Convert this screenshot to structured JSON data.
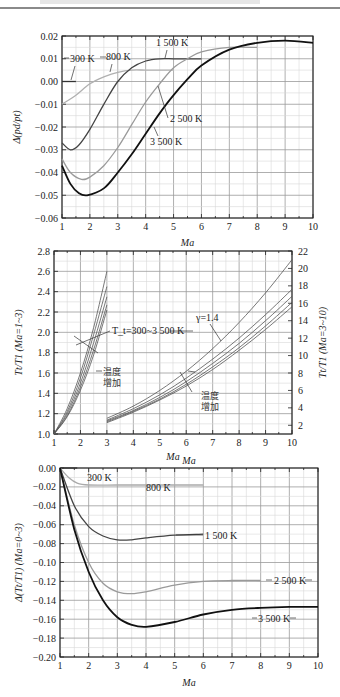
{
  "page": {
    "header_rule": true
  },
  "chart_data": [
    {
      "type": "line",
      "title": "",
      "xlabel": "Ma",
      "ylabel": "Δ(p_d/p_t)",
      "xlim": [
        1,
        10
      ],
      "ylim": [
        -0.06,
        0.02
      ],
      "xticks": [
        "1",
        "2",
        "3",
        "4",
        "5",
        "6",
        "7",
        "8",
        "9",
        "10"
      ],
      "yticks": [
        "0.02",
        "0.01",
        "0.00",
        "-0.01",
        "-0.02",
        "-0.03",
        "-0.04",
        "-0.05",
        "-0.06"
      ],
      "grid": true,
      "series": [
        {
          "name": "300 K",
          "color": "#333333",
          "x": [
            1.0,
            1.5
          ],
          "y": [
            0.0,
            0.0
          ]
        },
        {
          "name": "800 K",
          "color": "#b0b0b0",
          "x": [
            1.0,
            1.5,
            2.0,
            2.5,
            3.0,
            3.5,
            4.0,
            4.5,
            5.0
          ],
          "y": [
            -0.01,
            -0.006,
            -0.001,
            0.002,
            0.004,
            0.005,
            0.005,
            0.005,
            0.005
          ]
        },
        {
          "name": "1 500 K",
          "color": "#444444",
          "x": [
            1.0,
            1.3,
            1.6,
            2.0,
            2.5,
            3.0,
            3.5,
            4.0,
            4.5,
            5.0,
            5.5,
            6.0
          ],
          "y": [
            -0.027,
            -0.03,
            -0.028,
            -0.021,
            -0.01,
            0.0,
            0.006,
            0.009,
            0.01,
            0.01,
            0.01,
            0.01
          ]
        },
        {
          "name": "2 500 K",
          "color": "#9a9a9a",
          "x": [
            1.0,
            1.3,
            1.7,
            2.0,
            2.5,
            3.0,
            3.5,
            4.0,
            4.5,
            5.0,
            5.5,
            6.0,
            7.0,
            8.0
          ],
          "y": [
            -0.034,
            -0.04,
            -0.043,
            -0.042,
            -0.037,
            -0.029,
            -0.019,
            -0.009,
            -0.001,
            0.006,
            0.01,
            0.013,
            0.015,
            0.015
          ]
        },
        {
          "name": "3 500 K",
          "color": "#111111",
          "x": [
            1.0,
            1.3,
            1.6,
            1.9,
            2.5,
            3.0,
            3.5,
            4.0,
            4.5,
            5.0,
            5.5,
            6.0,
            7.0,
            8.0,
            9.0,
            10.0
          ],
          "y": [
            -0.037,
            -0.045,
            -0.049,
            -0.05,
            -0.047,
            -0.04,
            -0.032,
            -0.023,
            -0.014,
            -0.006,
            0.001,
            0.007,
            0.014,
            0.017,
            0.018,
            0.017
          ]
        }
      ],
      "annotations": [
        "300 K",
        "800 K",
        "1 500 K",
        "2 500 K",
        "3 500 K"
      ]
    },
    {
      "type": "line",
      "title": "",
      "xlabel": "Ma",
      "ylabel": "T_t/T_1 (Ma=1~3)",
      "ylabel_right": "T_t/T_1 (Ma=3~10)",
      "xlim": [
        1,
        10
      ],
      "ylim": [
        1.0,
        2.8
      ],
      "ylim_right": [
        1,
        22
      ],
      "xticks": [
        "1",
        "2",
        "3",
        "4",
        "5",
        "6",
        "7",
        "8",
        "9",
        "10"
      ],
      "yticks": [
        "2.8",
        "2.6",
        "2.4",
        "2.2",
        "2.0",
        "1.8",
        "1.6",
        "1.4",
        "1.2",
        "1.0"
      ],
      "yticks_right": [
        "22",
        "20",
        "18",
        "16",
        "14",
        "12",
        "10",
        "8",
        "6",
        "4",
        "2"
      ],
      "grid": true,
      "series": [
        {
          "name": "γ=1.4 (Ma 1-3)",
          "axis": "left",
          "x": [
            1.0,
            1.5,
            2.0,
            2.5,
            3.0
          ],
          "y": [
            1.0,
            1.25,
            1.6,
            2.05,
            2.6
          ]
        },
        {
          "name": "T 800 K (Ma 1-3)",
          "axis": "left",
          "x": [
            1.0,
            1.5,
            2.0,
            2.5,
            3.0
          ],
          "y": [
            1.0,
            1.22,
            1.55,
            1.98,
            2.45
          ]
        },
        {
          "name": "T 1 500 K (Ma 1-3)",
          "axis": "left",
          "x": [
            1.0,
            1.5,
            2.0,
            2.5,
            3.0
          ],
          "y": [
            1.0,
            1.2,
            1.5,
            1.9,
            2.35
          ]
        },
        {
          "name": "T 2 500 K (Ma 1-3)",
          "axis": "left",
          "x": [
            1.0,
            1.5,
            2.0,
            2.5,
            3.0
          ],
          "y": [
            1.0,
            1.18,
            1.46,
            1.83,
            2.27
          ]
        },
        {
          "name": "T 3 500 K (Ma 1-3)",
          "axis": "left",
          "x": [
            1.0,
            1.5,
            2.0,
            2.5,
            3.0
          ],
          "y": [
            1.0,
            1.17,
            1.43,
            1.78,
            2.22
          ]
        },
        {
          "name": "γ=1.4 (Ma 3-10)",
          "axis": "right",
          "x": [
            3,
            4,
            5,
            6,
            7,
            8,
            9,
            10
          ],
          "y": [
            2.8,
            4.2,
            6.0,
            8.2,
            10.8,
            13.8,
            17.2,
            21.0
          ]
        },
        {
          "name": "T 800 K (Ma 3-10)",
          "axis": "right",
          "x": [
            3,
            4,
            5,
            6,
            7,
            8,
            9,
            10
          ],
          "y": [
            2.6,
            3.9,
            5.5,
            7.4,
            9.6,
            12.0,
            14.7,
            17.6
          ]
        },
        {
          "name": "T 1 500 K (Ma 3-10)",
          "axis": "right",
          "x": [
            3,
            4,
            5,
            6,
            7,
            8,
            9,
            10
          ],
          "y": [
            2.5,
            3.7,
            5.2,
            7.0,
            9.1,
            11.4,
            14.0,
            16.8
          ]
        },
        {
          "name": "T 2 500 K (Ma 3-10)",
          "axis": "right",
          "x": [
            3,
            4,
            5,
            6,
            7,
            8,
            9,
            10
          ],
          "y": [
            2.4,
            3.6,
            5.0,
            6.7,
            8.7,
            10.9,
            13.4,
            16.1
          ]
        },
        {
          "name": "T 3 500 K (Ma 3-10)",
          "axis": "right",
          "x": [
            3,
            4,
            5,
            6,
            7,
            8,
            9,
            10
          ],
          "y": [
            2.3,
            3.5,
            4.9,
            6.5,
            8.4,
            10.6,
            13.0,
            15.6
          ]
        }
      ],
      "annotations": [
        "T_t=300~3 500 K",
        "γ=1.4",
        "温度增加",
        "温度增加"
      ]
    },
    {
      "type": "line",
      "title": "",
      "xlabel": "Ma",
      "ylabel": "Δ(T_t/T_1) (Ma=0~3)",
      "xlim": [
        1,
        10
      ],
      "ylim": [
        -0.2,
        0.0
      ],
      "xticks": [
        "1",
        "2",
        "3",
        "4",
        "5",
        "6",
        "7",
        "8",
        "9",
        "10"
      ],
      "yticks": [
        "0.00",
        "-0.02",
        "-0.04",
        "-0.06",
        "-0.08",
        "-0.10",
        "-0.12",
        "-0.14",
        "-0.16",
        "-0.18",
        "-0.20"
      ],
      "grid": true,
      "series": [
        {
          "name": "300 K",
          "color": "#333333",
          "x": [
            1.0,
            1.3,
            1.6
          ],
          "y": [
            0.0,
            0.0,
            0.0
          ]
        },
        {
          "name": "800 K",
          "color": "#aaaaaa",
          "x": [
            1.0,
            1.3,
            1.6,
            2.0,
            3.0,
            4.0,
            5.0,
            6.0
          ],
          "y": [
            0.0,
            -0.01,
            -0.016,
            -0.018,
            -0.018,
            -0.018,
            -0.018,
            -0.018
          ]
        },
        {
          "name": "1 500 K",
          "color": "#444444",
          "x": [
            1.0,
            1.5,
            2.0,
            2.5,
            3.0,
            3.5,
            4.0,
            5.0,
            6.0
          ],
          "y": [
            0.0,
            -0.04,
            -0.062,
            -0.072,
            -0.076,
            -0.076,
            -0.074,
            -0.071,
            -0.07
          ]
        },
        {
          "name": "2 500 K",
          "color": "#9a9a9a",
          "x": [
            1.0,
            1.5,
            2.0,
            2.5,
            3.0,
            3.5,
            4.0,
            5.0,
            6.0,
            7.0,
            8.0
          ],
          "y": [
            0.0,
            -0.06,
            -0.1,
            -0.122,
            -0.131,
            -0.133,
            -0.131,
            -0.124,
            -0.12,
            -0.119,
            -0.119
          ]
        },
        {
          "name": "3 500 K",
          "color": "#111111",
          "x": [
            1.0,
            1.5,
            2.0,
            2.5,
            3.0,
            3.5,
            4.0,
            5.0,
            6.0,
            7.0,
            8.0,
            9.0,
            10.0
          ],
          "y": [
            0.0,
            -0.065,
            -0.11,
            -0.14,
            -0.158,
            -0.166,
            -0.168,
            -0.163,
            -0.155,
            -0.15,
            -0.148,
            -0.147,
            -0.147
          ]
        }
      ],
      "annotations": [
        "300 K",
        "800 K",
        "1 500 K",
        "2 500 K",
        "3 500 K"
      ]
    }
  ]
}
